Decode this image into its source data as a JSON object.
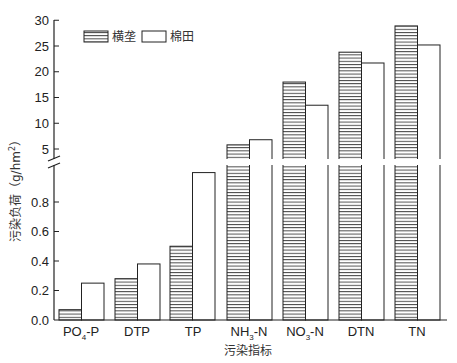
{
  "chart_data": {
    "type": "bar",
    "title": "",
    "xlabel": "污染指标",
    "ylabel": "污染负荷（g/hm²）",
    "ylabel_text": "污染负荷",
    "ylabel_unit": "（g/hm",
    "ylabel_sup": "2",
    "ylabel_close": "）",
    "categories": [
      "PO4-P",
      "DTP",
      "TP",
      "NH3-N",
      "NO3-N",
      "DTN",
      "TN"
    ],
    "category_labels": [
      {
        "main": "PO",
        "sub": "4",
        "rest": "-P"
      },
      {
        "main": "DTP",
        "sub": "",
        "rest": ""
      },
      {
        "main": "TP",
        "sub": "",
        "rest": ""
      },
      {
        "main": "NH",
        "sub": "3",
        "rest": "-N"
      },
      {
        "main": "NO",
        "sub": "3",
        "rest": "-N"
      },
      {
        "main": "DTN",
        "sub": "",
        "rest": ""
      },
      {
        "main": "TN",
        "sub": "",
        "rest": ""
      }
    ],
    "series": [
      {
        "name": "横垄",
        "pattern": "horizontal-hatch",
        "values": [
          0.07,
          0.28,
          0.5,
          5.8,
          18.0,
          23.8,
          28.9
        ]
      },
      {
        "name": "棉田",
        "pattern": "open",
        "values": [
          0.25,
          0.38,
          1.4,
          6.8,
          13.5,
          21.7,
          25.2
        ]
      }
    ],
    "y_axis": {
      "broken": true,
      "lower_segment": {
        "range": [
          0,
          1.0
        ],
        "ticks": [
          "0.0",
          "0.2",
          "0.4",
          "0.6",
          "0.8"
        ]
      },
      "upper_segment": {
        "range": [
          2.3,
          30
        ],
        "ticks": [
          "5",
          "10",
          "15",
          "20",
          "25",
          "30"
        ]
      }
    },
    "grid": false,
    "legend_position": "top-left"
  },
  "legend": {
    "items": [
      {
        "label": "横垄"
      },
      {
        "label": "棉田"
      }
    ]
  },
  "colors": {
    "stroke": "#222222",
    "hatch": "#333333",
    "fill_open": "#ffffff"
  }
}
